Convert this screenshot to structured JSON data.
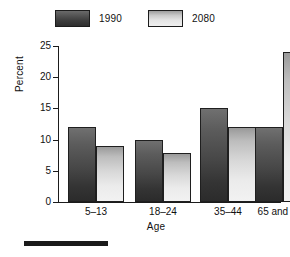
{
  "chart_data": {
    "type": "bar",
    "title": "",
    "xlabel": "Age",
    "ylabel": "Percent",
    "categories": [
      "5–13",
      "18–24",
      "35–44",
      "65 and over"
    ],
    "series": [
      {
        "name": "1990",
        "values": [
          12.0,
          10.0,
          15.1,
          12.1
        ],
        "color": "#4a4a4a"
      },
      {
        "name": "2080",
        "values": [
          9.0,
          7.8,
          12.1,
          24.0
        ],
        "color": "#d9d9d9"
      }
    ],
    "ylim": [
      0,
      25
    ],
    "yticks": [
      0,
      5,
      10,
      15,
      20,
      25
    ],
    "ytick_labels": [
      "0",
      "5",
      "10",
      "15",
      "20",
      "25"
    ],
    "grid": false,
    "legend_position": "top"
  },
  "legend": {
    "items": [
      {
        "label": "1990"
      },
      {
        "label": "2080"
      }
    ]
  },
  "axes": {
    "y_title": "Percent",
    "x_title": "Age",
    "y_labels": [
      "25",
      "20",
      "15",
      "10",
      "5",
      "0"
    ],
    "x_labels": [
      "5–13",
      "18–24",
      "35–44",
      "65 and over"
    ]
  },
  "footer": {
    "rule": ""
  }
}
